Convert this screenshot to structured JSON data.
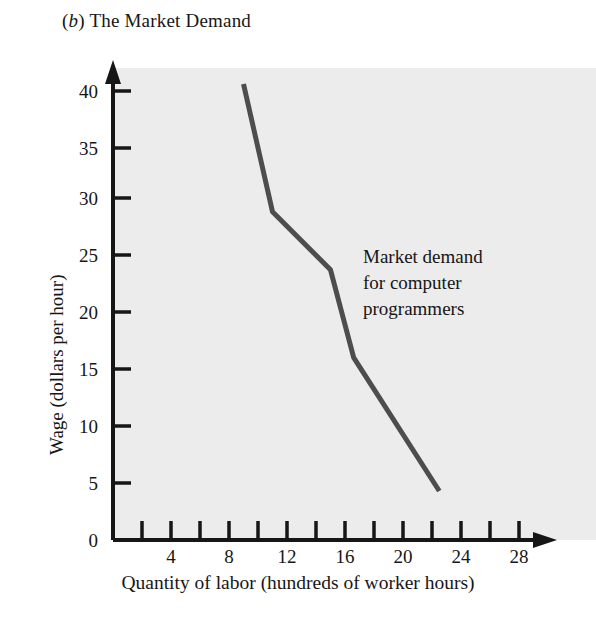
{
  "figure": {
    "panel_letter": "b",
    "panel_title": "The Market Demand",
    "title_prefix": "(",
    "title_suffix": ")",
    "background_color": "#ececec",
    "page_color": "#ffffff",
    "axis_color": "#161616",
    "curve_color": "#4d4d4d"
  },
  "annotation": {
    "line1": "Market demand",
    "line2": "for computer",
    "line3": "programmers"
  },
  "chart_data": {
    "type": "line",
    "title": "(b) The Market Demand",
    "xlabel": "Quantity of labor (hundreds of worker hours)",
    "ylabel": "Wage (dollars per hour)",
    "xlim": [
      0,
      30
    ],
    "ylim": [
      0,
      42
    ],
    "grid": false,
    "legend": "none",
    "x_major_ticks": [
      2,
      4,
      6,
      8,
      10,
      12,
      14,
      16,
      18,
      20,
      22,
      24,
      26,
      28
    ],
    "x_tick_labels": [
      {
        "value": 4,
        "label": "4"
      },
      {
        "value": 8,
        "label": "8"
      },
      {
        "value": 12,
        "label": "12"
      },
      {
        "value": 16,
        "label": "16"
      },
      {
        "value": 20,
        "label": "20"
      },
      {
        "value": 24,
        "label": "24"
      },
      {
        "value": 28,
        "label": "28"
      }
    ],
    "y_major_ticks": [
      0,
      5,
      10,
      15,
      20,
      25,
      30,
      35,
      40
    ],
    "y_tick_labels": [
      {
        "value": 0,
        "label": "0"
      },
      {
        "value": 5,
        "label": "5"
      },
      {
        "value": 10,
        "label": "10"
      },
      {
        "value": 15,
        "label": "15"
      },
      {
        "value": 20,
        "label": "20"
      },
      {
        "value": 25,
        "label": "25"
      },
      {
        "value": 30,
        "label": "30"
      },
      {
        "value": 35,
        "label": "35"
      },
      {
        "value": 40,
        "label": "40"
      }
    ],
    "series": [
      {
        "name": "Market demand for computer programmers",
        "color": "#4d4d4d",
        "linewidth": 5,
        "points": [
          {
            "x": 9.0,
            "y": 40.0
          },
          {
            "x": 11.0,
            "y": 28.8
          },
          {
            "x": 15.0,
            "y": 23.7
          },
          {
            "x": 16.6,
            "y": 16.0
          },
          {
            "x": 22.5,
            "y": 4.3
          }
        ]
      }
    ],
    "annotations": [
      {
        "text": "Market demand for computer programmers",
        "x": 19.5,
        "y": 25.5
      }
    ]
  }
}
